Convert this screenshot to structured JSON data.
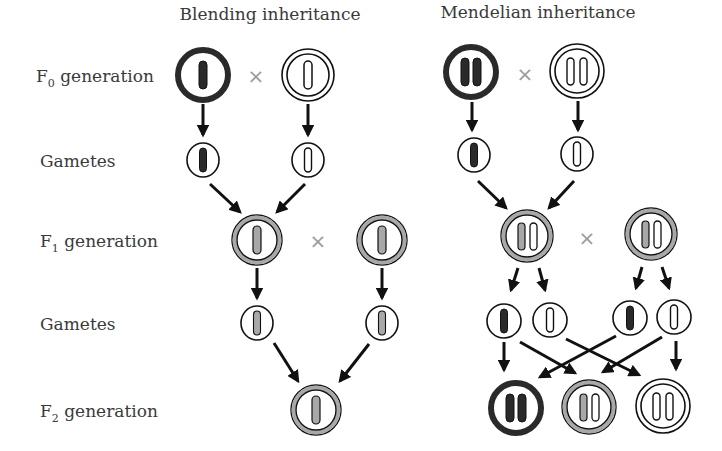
{
  "titles": {
    "blending": "Blending inheritance",
    "mendelian": "Mendelian inheritance"
  },
  "row_labels": {
    "f0": {
      "letter": "F",
      "sub": "0",
      "rest": " generation"
    },
    "gametes1": "Gametes",
    "f1": {
      "letter": "F",
      "sub": "1",
      "rest": " generation"
    },
    "gametes2": "Gametes",
    "f2": {
      "letter": "F",
      "sub": "2",
      "rest": " generation"
    }
  },
  "cross_symbol": "×",
  "colors": {
    "dark": "#2a2a2a",
    "gray": "#a8a8a8",
    "white": "#ffffff",
    "stroke": "#111111",
    "label": "#3a3a3a",
    "cross": "#9a9a9a"
  },
  "blending": {
    "f0": [
      {
        "type": "dark",
        "alleles": 1
      },
      {
        "type": "white",
        "alleles": 1
      }
    ],
    "gametes1": [
      {
        "allele": "dark"
      },
      {
        "allele": "white"
      }
    ],
    "f1": [
      {
        "type": "gray",
        "alleles": 1
      },
      {
        "type": "gray",
        "alleles": 1
      }
    ],
    "gametes2": [
      {
        "allele": "gray"
      },
      {
        "allele": "gray"
      }
    ],
    "f2": [
      {
        "type": "gray",
        "alleles": 1
      }
    ]
  },
  "mendelian": {
    "f0": [
      {
        "type": "dark",
        "alleles": [
          "dark",
          "dark"
        ]
      },
      {
        "type": "white",
        "alleles": [
          "white",
          "white"
        ]
      }
    ],
    "gametes1": [
      {
        "allele": "dark"
      },
      {
        "allele": "white"
      }
    ],
    "f1": [
      {
        "type": "gray",
        "alleles": [
          "dark",
          "white"
        ]
      },
      {
        "type": "gray",
        "alleles": [
          "dark",
          "white"
        ]
      }
    ],
    "gametes2": [
      {
        "allele": "dark"
      },
      {
        "allele": "white"
      },
      {
        "allele": "dark"
      },
      {
        "allele": "white"
      }
    ],
    "f2": [
      {
        "type": "dark",
        "alleles": [
          "dark",
          "dark"
        ]
      },
      {
        "type": "gray",
        "alleles": [
          "dark",
          "white"
        ]
      },
      {
        "type": "white",
        "alleles": [
          "white",
          "white"
        ]
      }
    ]
  }
}
